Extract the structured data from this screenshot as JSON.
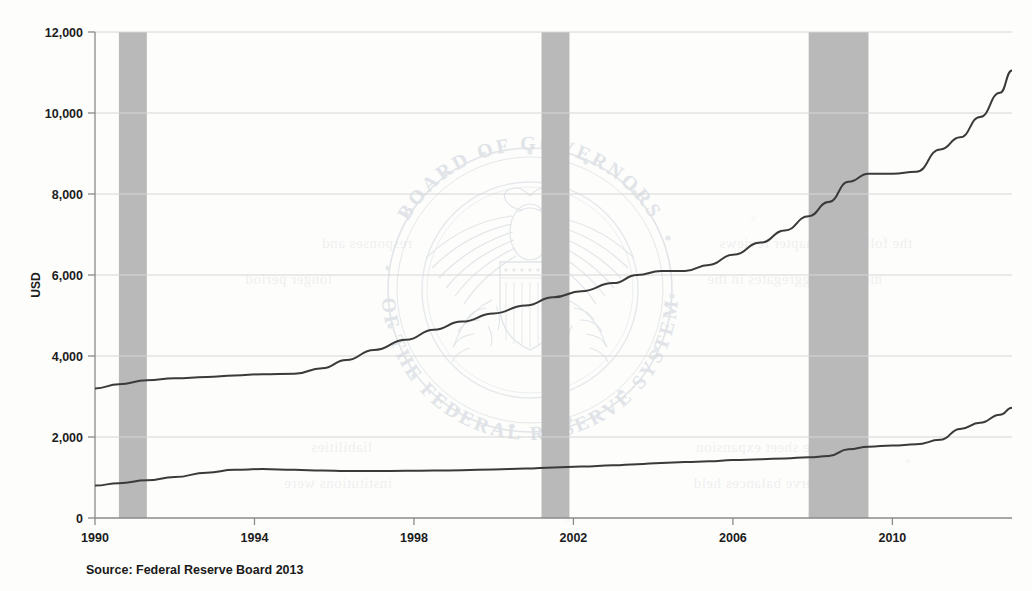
{
  "figure": {
    "source_note": "Source: Federal Reserve Board 2013",
    "watermark": {
      "top_arc": "BOARD OF GOVERNORS",
      "bottom_arc": "OF THE FEDERAL RESERVE SYSTEM",
      "emblem": "federal-reserve-seal-eagle"
    }
  },
  "colors": {
    "line": "#3a3a3a",
    "recession_band": "#b9b9b9",
    "gridline": "#d6d6d6",
    "axis": "#8a8a8a",
    "text": "#1c1c1c",
    "watermark": "#ccd2d8",
    "paper": "#fdfdfc"
  },
  "chart_data": {
    "type": "line",
    "title": "",
    "xlabel": "",
    "ylabel": "USD",
    "xlim": [
      1990,
      2013
    ],
    "ylim": [
      0,
      12000
    ],
    "ytick_labels": [
      "0",
      "2,000",
      "4,000",
      "6,000",
      "8,000",
      "10,000",
      "12,000"
    ],
    "yticks": [
      0,
      2000,
      4000,
      6000,
      8000,
      10000,
      12000
    ],
    "xtick_labels": [
      "1990",
      "1994",
      "1998",
      "2002",
      "2006",
      "2010"
    ],
    "xticks": [
      1990,
      1994,
      1998,
      2002,
      2006,
      2010
    ],
    "grid": "horizontal",
    "legend": "none",
    "shaded_regions": [
      {
        "label": "recession",
        "x_start": 1990.6,
        "x_end": 1991.3
      },
      {
        "label": "recession",
        "x_start": 2001.2,
        "x_end": 2001.9
      },
      {
        "label": "recession",
        "x_start": 2007.9,
        "x_end": 2009.4
      }
    ],
    "series": [
      {
        "name": "upper-line",
        "x": [
          1990.0,
          1990.6,
          1991.3,
          1992.0,
          1992.8,
          1993.5,
          1994.2,
          1995.0,
          1995.7,
          1996.3,
          1997.0,
          1997.8,
          1998.5,
          1999.2,
          2000.0,
          2000.8,
          2001.5,
          2002.2,
          2003.0,
          2003.6,
          2004.2,
          2004.8,
          2005.4,
          2006.0,
          2006.7,
          2007.3,
          2007.9,
          2008.4,
          2008.9,
          2009.4,
          2010.0,
          2010.6,
          2011.2,
          2011.7,
          2012.2,
          2012.7,
          2013.0
        ],
        "y": [
          3200,
          3300,
          3400,
          3450,
          3480,
          3520,
          3550,
          3560,
          3700,
          3900,
          4150,
          4400,
          4650,
          4850,
          5050,
          5250,
          5450,
          5600,
          5800,
          6000,
          6100,
          6100,
          6250,
          6500,
          6800,
          7100,
          7450,
          7800,
          8300,
          8500,
          8500,
          8550,
          9100,
          9400,
          9900,
          10500,
          11050
        ]
      },
      {
        "name": "lower-line",
        "x": [
          1990.0,
          1990.6,
          1991.3,
          1992.0,
          1992.8,
          1993.5,
          1994.2,
          1995.0,
          1995.7,
          1996.3,
          1997.0,
          1997.8,
          1998.5,
          1999.2,
          2000.0,
          2000.8,
          2001.5,
          2002.2,
          2003.0,
          2003.6,
          2004.2,
          2004.8,
          2005.4,
          2006.0,
          2006.7,
          2007.3,
          2007.9,
          2008.4,
          2008.9,
          2009.4,
          2010.0,
          2010.6,
          2011.2,
          2011.7,
          2012.2,
          2012.7,
          2013.0
        ],
        "y": [
          800,
          860,
          930,
          1010,
          1120,
          1190,
          1210,
          1190,
          1170,
          1160,
          1160,
          1165,
          1170,
          1180,
          1200,
          1220,
          1250,
          1270,
          1300,
          1330,
          1360,
          1380,
          1400,
          1430,
          1450,
          1470,
          1500,
          1530,
          1700,
          1760,
          1790,
          1820,
          1930,
          2200,
          2350,
          2550,
          2720
        ]
      }
    ]
  }
}
